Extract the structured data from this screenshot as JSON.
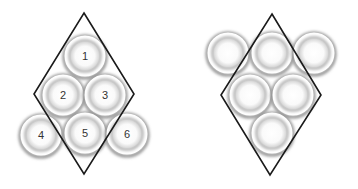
{
  "figures": [
    {
      "name": "numbered-packing",
      "diamond": {
        "top": [
          84,
          13
        ],
        "right": [
          134,
          94
        ],
        "bottom": [
          84,
          174
        ],
        "left": [
          34,
          94
        ]
      },
      "circles": [
        {
          "label": "1",
          "cx": 85,
          "cy": 56
        },
        {
          "label": "2",
          "cx": 63,
          "cy": 95
        },
        {
          "label": "3",
          "cx": 105,
          "cy": 95
        },
        {
          "label": "4",
          "cx": 41,
          "cy": 135
        },
        {
          "label": "5",
          "cx": 85,
          "cy": 133
        },
        {
          "label": "6",
          "cx": 127,
          "cy": 134
        }
      ]
    },
    {
      "name": "unnumbered-packing",
      "diamond": {
        "top": [
          272,
          14
        ],
        "right": [
          321,
          95
        ],
        "bottom": [
          270,
          175
        ],
        "left": [
          221,
          95
        ]
      },
      "circles": [
        {
          "label": "",
          "cx": 228,
          "cy": 53
        },
        {
          "label": "",
          "cx": 272,
          "cy": 53
        },
        {
          "label": "",
          "cx": 314,
          "cy": 53
        },
        {
          "label": "",
          "cx": 250,
          "cy": 95
        },
        {
          "label": "",
          "cx": 293,
          "cy": 95
        },
        {
          "label": "",
          "cx": 272,
          "cy": 133
        }
      ]
    }
  ],
  "colors": {
    "outline": "#1a1a1a",
    "ring": "#9a9a9a",
    "label": "#333333"
  }
}
